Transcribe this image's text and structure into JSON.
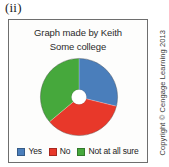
{
  "figure": {
    "label": "(ii)",
    "copyright": "Copyright © Cengage Learning 2013"
  },
  "chart_data": {
    "type": "pie",
    "title": "Graph made by Keith",
    "subtitle": "Some college",
    "xlabel": "",
    "ylabel": "",
    "donut": true,
    "legend_position": "bottom",
    "grid": false,
    "start_angle_deg": 0,
    "direction": "clockwise",
    "categories": [
      "Yes",
      "No",
      "Not at all sure"
    ],
    "values": [
      29,
      35,
      36
    ],
    "units": "percent",
    "colors": [
      "#4a7ebb",
      "#e8382a",
      "#46a83c"
    ],
    "slices": [
      {
        "label": "Yes",
        "value": 29,
        "color": "#4a7ebb",
        "start_deg": 0,
        "end_deg": 104
      },
      {
        "label": "No",
        "value": 35,
        "color": "#e8382a",
        "start_deg": 104,
        "end_deg": 230
      },
      {
        "label": "Not at all sure",
        "value": 36,
        "color": "#46a83c",
        "start_deg": 230,
        "end_deg": 360
      }
    ]
  },
  "legend": {
    "items": [
      {
        "label": "Yes",
        "color": "#4a7ebb"
      },
      {
        "label": "No",
        "color": "#e8382a"
      },
      {
        "label": "Not at all sure",
        "color": "#46a83c"
      }
    ]
  }
}
